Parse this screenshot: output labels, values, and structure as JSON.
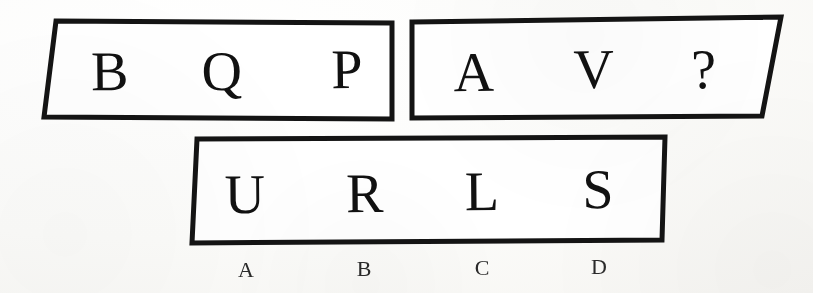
{
  "page": {
    "background_color": "#fbfbf9",
    "ink_color": "#141414",
    "width": 813,
    "height": 293
  },
  "puzzle": {
    "type": "letter-sequence-multiple-choice",
    "rows": [
      {
        "id": "row-1",
        "boxes": [
          {
            "id": "box-1",
            "cells": [
              "B",
              "Q",
              "P"
            ]
          },
          {
            "id": "box-2",
            "cells": [
              "A",
              "V",
              "?"
            ]
          }
        ]
      },
      {
        "id": "row-2",
        "boxes": [
          {
            "id": "box-3",
            "cells": [
              "U",
              "R",
              "L",
              "S"
            ]
          }
        ]
      }
    ],
    "answer_options": [
      {
        "key": "A",
        "choice": "U"
      },
      {
        "key": "B",
        "choice": "R"
      },
      {
        "key": "C",
        "choice": "L"
      },
      {
        "key": "D",
        "choice": "S"
      }
    ]
  },
  "geometry": {
    "box1": {
      "points": "56,21 392,23 392,119 44,117",
      "cells": [
        {
          "label": "B",
          "x": 110,
          "y": 90
        },
        {
          "label": "Q",
          "x": 222,
          "y": 90
        },
        {
          "label": "P",
          "x": 347,
          "y": 88
        }
      ]
    },
    "box2": {
      "points": "412,22 781,17 762,116 412,118",
      "cells": [
        {
          "label": "A",
          "x": 474,
          "y": 91
        },
        {
          "label": "V",
          "x": 594,
          "y": 88
        },
        {
          "label": "?",
          "x": 704,
          "y": 88
        }
      ]
    },
    "box3": {
      "points": "197,139 665,137 662,240 192,243",
      "cells": [
        {
          "label": "U",
          "x": 245,
          "y": 213
        },
        {
          "label": "R",
          "x": 365,
          "y": 212
        },
        {
          "label": "L",
          "x": 482,
          "y": 210
        },
        {
          "label": "S",
          "x": 598,
          "y": 208
        }
      ]
    },
    "options": [
      {
        "label": "A",
        "x": 246,
        "y": 277
      },
      {
        "label": "B",
        "x": 364,
        "y": 276
      },
      {
        "label": "C",
        "x": 482,
        "y": 275
      },
      {
        "label": "D",
        "x": 599,
        "y": 274
      }
    ]
  }
}
